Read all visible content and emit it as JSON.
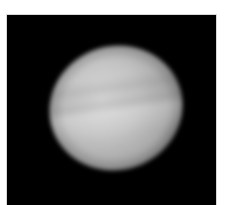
{
  "image": {
    "subject": "planet",
    "description": "Grayscale telescope image of a banded planetary disk on black background",
    "colors": {
      "background": "#000000",
      "page": "#ffffff",
      "disk_highlight": "#d9d9d9",
      "disk_mid": "#a6a6a6",
      "disk_edge": "#222222"
    }
  }
}
